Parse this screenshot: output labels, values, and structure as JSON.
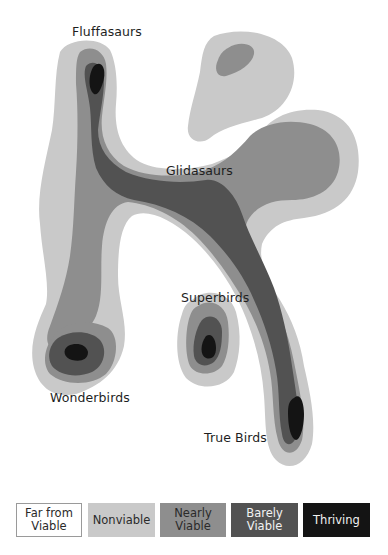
{
  "colors": {
    "far_from_viable": "#ffffff",
    "nonviable": "#c9c9c9",
    "nearly_viable": "#8e8e8e",
    "barely_viable": "#525252",
    "thriving": "#141414",
    "label_text": "#1e1e1e"
  },
  "regions": [
    {
      "name": "Fluffasaurs",
      "peak_level": "Thriving"
    },
    {
      "name": "Glidasaurs",
      "peak_level": "Barely Viable"
    },
    {
      "name": "Superbirds",
      "peak_level": "Thriving"
    },
    {
      "name": "Wonderbirds",
      "peak_level": "Thriving"
    },
    {
      "name": "True Birds",
      "peak_level": "Thriving"
    }
  ],
  "labels": {
    "fluffasaurs": "Fluffasaurs",
    "glidasaurs": "Glidasaurs",
    "superbirds": "Superbirds",
    "wonderbirds": "Wonderbirds",
    "true_birds": "True Birds"
  },
  "legend": [
    {
      "label": "Far from\nViable",
      "color": "#ffffff",
      "text_color": "#2a2a2a"
    },
    {
      "label": "Nonviable",
      "color": "#c9c9c9",
      "text_color": "#2a2a2a"
    },
    {
      "label": "Nearly\nViable",
      "color": "#8e8e8e",
      "text_color": "#2a2a2a"
    },
    {
      "label": "Barely\nViable",
      "color": "#525252",
      "text_color": "#f2f2f2"
    },
    {
      "label": "Thriving",
      "color": "#141414",
      "text_color": "#f2f2f2"
    }
  ]
}
